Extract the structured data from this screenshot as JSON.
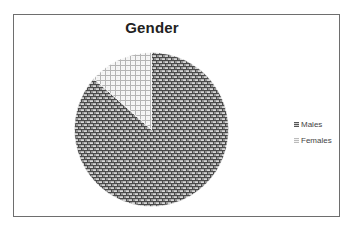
{
  "chart_data": {
    "type": "pie",
    "title": "Gender",
    "categories": [
      "Males",
      "Females"
    ],
    "values": [
      86.5,
      13.5
    ],
    "unit": "percent (estimated from slice angles)",
    "start_angle_deg": 0,
    "direction": "clockwise from 12 o'clock",
    "patterns": {
      "Males": "dark brick/weave pattern",
      "Females": "light gray grid pattern"
    },
    "legend": {
      "position": "right",
      "entries": [
        "Males",
        "Females"
      ]
    },
    "data_labels": false
  },
  "legend": {
    "items": [
      {
        "label": "Males"
      },
      {
        "label": "Females"
      }
    ]
  },
  "colors": {
    "males_line": "#4a4a4a",
    "males_bg": "#d6d6d6",
    "females_line": "#b4b4b4",
    "females_bg": "#f6f6f6",
    "frame": "#6e6e6e",
    "title": "#222222"
  }
}
